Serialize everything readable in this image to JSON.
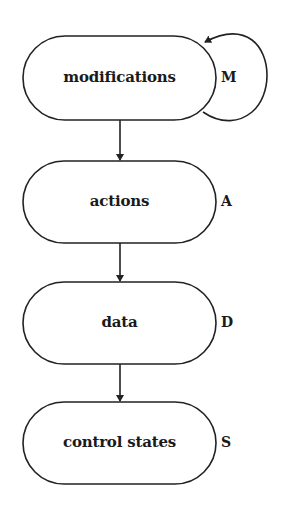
{
  "diagram": {
    "type": "flow-hierarchy",
    "stroke_color": "#222222",
    "background": "#ffffff",
    "nodes": [
      {
        "id": "modifications",
        "label": "modifications",
        "tag": "M",
        "self_loop": true
      },
      {
        "id": "actions",
        "label": "actions",
        "tag": "A",
        "self_loop": false
      },
      {
        "id": "data",
        "label": "data",
        "tag": "D",
        "self_loop": false
      },
      {
        "id": "control_states",
        "label": "control states",
        "tag": "S",
        "self_loop": false
      }
    ],
    "edges": [
      {
        "from": "modifications",
        "to": "modifications"
      },
      {
        "from": "modifications",
        "to": "actions"
      },
      {
        "from": "actions",
        "to": "data"
      },
      {
        "from": "data",
        "to": "control_states"
      }
    ]
  }
}
